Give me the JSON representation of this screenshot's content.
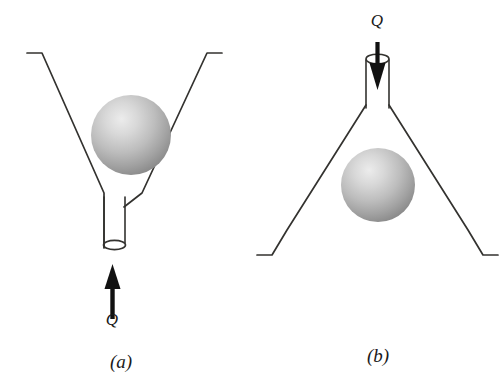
{
  "figure": {
    "background_color": "#ffffff",
    "line_color": "#33322f",
    "arrow_color": "#111111",
    "label_color": "#1a1a1a",
    "sphere_light_color": "#e8e8e8",
    "sphere_mid_color": "#b4b4b4",
    "sphere_dark_color": "#8a8a8a",
    "width": 502,
    "height": 384
  },
  "panels": [
    {
      "id": "a",
      "caption": "(a)",
      "flow_label": "Q",
      "flow_direction": "up",
      "description": "Ball resting in V-shaped diverging funnel, flow entering upward through narrow tube at the bottom",
      "caption_x": 121,
      "caption_y": 368,
      "flow_label_x": 112,
      "flow_label_y": 325,
      "sphere": {
        "cx": 131,
        "cy": 135,
        "r": 40
      }
    },
    {
      "id": "b",
      "caption": "(b)",
      "flow_label": "Q",
      "flow_direction": "down",
      "description": "Ball held in inverted funnel, flow entering downward through narrow tube at the top",
      "caption_x": 378,
      "caption_y": 362,
      "flow_label_x": 377,
      "flow_label_y": 26,
      "sphere": {
        "cx": 378,
        "cy": 185,
        "r": 37
      }
    }
  ],
  "icons": {
    "up_arrow": "arrow-up-icon",
    "down_arrow": "arrow-down-icon"
  }
}
